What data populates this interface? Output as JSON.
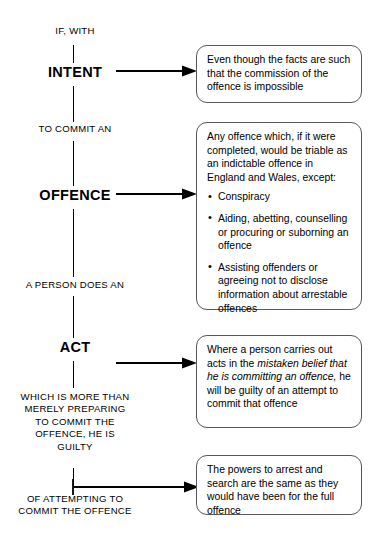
{
  "diagram": {
    "line_color": "#000000",
    "box_border_color": "#58585a",
    "spine": {
      "intro_label": "IF, WITH",
      "stages": [
        {
          "id": "intent",
          "label": "INTENT"
        },
        {
          "id": "offence",
          "label": "OFFENCE"
        },
        {
          "id": "act",
          "label": "ACT"
        }
      ],
      "connectors": [
        {
          "id": "to-commit-an",
          "text": "TO COMMIT AN"
        },
        {
          "id": "a-person-does-an",
          "text": "A PERSON DOES AN"
        },
        {
          "id": "which-is-more-than",
          "text": "WHICH IS MORE THAN\nMERELY PREPARING\nTO COMMIT THE\nOFFENCE, HE IS\nGUILTY"
        },
        {
          "id": "of-attempting",
          "text": "OF ATTEMPTING TO\nCOMMIT THE OFFENCE"
        }
      ]
    },
    "callouts": [
      {
        "id": "intent-note",
        "text": "Even though the facts are such that the commission of the offence is impossible"
      },
      {
        "id": "offence-note",
        "lead": "Any offence which, if it were completed, would be triable as an indictable offence in England and Wales, except:",
        "bullets": [
          "Conspiracy",
          "Aiding, abetting, counselling or procuring or suborning an offence",
          "Assisting offenders or agreeing not to disclose information about arrestable offences"
        ]
      },
      {
        "id": "act-note",
        "before_italic": "Where a person carries out acts in the ",
        "italic": "mistaken belief that he is committing an offence,",
        "after_italic": " he will be guilty of an attempt to commit that offence"
      },
      {
        "id": "powers-note",
        "text": "The powers to arrest and search are the same as they would have been for the full offence"
      }
    ]
  }
}
